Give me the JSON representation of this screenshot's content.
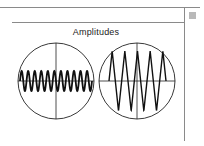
{
  "title": "Amplitudes",
  "colors": {
    "frame_line": "#8a8a8a",
    "corner_square": "#b9b9b9",
    "ink": "#111111"
  },
  "scopes": [
    {
      "name": "low-amplitude-high-frequency",
      "cycles": 11,
      "amplitude": 10
    },
    {
      "name": "high-amplitude-low-frequency",
      "cycles": 4.5,
      "amplitude": 30
    }
  ]
}
